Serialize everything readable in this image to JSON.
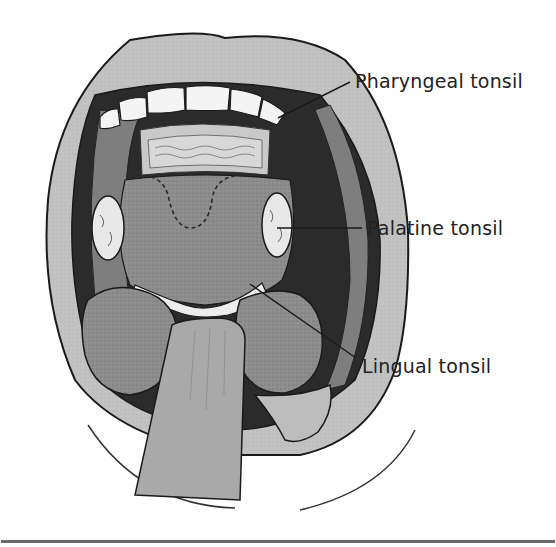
{
  "figure": {
    "labels": [
      {
        "id": "pharyngeal",
        "text": "Pharyngeal tonsil"
      },
      {
        "id": "palatine",
        "text": "Palatine tonsil"
      },
      {
        "id": "lingual",
        "text": "Lingual tonsil"
      }
    ],
    "colors": {
      "outline": "#1a1a1a",
      "lip": "#bdbdbd",
      "mouth_dark": "#2b2b2b",
      "tongue": "#8f8f8f",
      "tonsil": "#e8e8e8",
      "teeth": "#f4f4f4",
      "depressor": "#a9a9a9",
      "rule": "#6a6a6a"
    }
  }
}
